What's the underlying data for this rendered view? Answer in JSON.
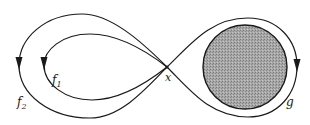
{
  "diagram": {
    "type": "figure-eight loops with disk",
    "labels": {
      "f1": "f",
      "f1_sub": "1",
      "f2": "f",
      "f2_sub": "2",
      "x": "x",
      "g": "g"
    },
    "colors": {
      "stroke": "#1a1a1a",
      "disk_fill": "#9a9a9a",
      "background": "#ffffff"
    },
    "elements": [
      {
        "name": "loop-f1",
        "description": "inner left loop through x, arrow pointing down on left side"
      },
      {
        "name": "loop-f2",
        "description": "outer left loop through x, arrow pointing down on left side"
      },
      {
        "name": "loop-g",
        "description": "right loop through x encircling shaded disk, arrow pointing down on right side"
      },
      {
        "name": "shaded-disk",
        "description": "grey stippled disk inside loop g"
      },
      {
        "name": "basepoint-x",
        "description": "crossing point of all loops"
      }
    ]
  }
}
